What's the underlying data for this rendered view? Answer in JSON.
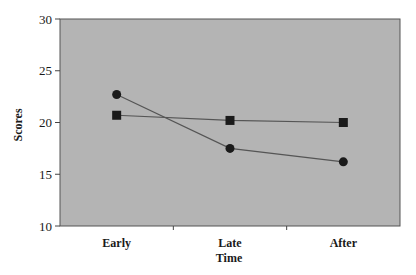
{
  "chart_data": {
    "type": "line",
    "title": "",
    "xlabel": "Time",
    "ylabel": "Scores",
    "categories": [
      "Early",
      "Late",
      "After"
    ],
    "series": [
      {
        "name": "Series 1 (circle markers)",
        "marker": "circle",
        "values": [
          22.7,
          17.5,
          16.2
        ]
      },
      {
        "name": "Series 2 (square markers)",
        "marker": "square",
        "values": [
          20.7,
          20.2,
          20.0
        ]
      }
    ],
    "ylim": [
      10,
      30
    ],
    "yticks": [
      10,
      15,
      20,
      25,
      30
    ],
    "grid": false,
    "legend": "none"
  },
  "colors": {
    "plot_background": "#b4b4b4",
    "line": "#555555",
    "marker": "#1a1a1a",
    "axis": "#444444"
  }
}
